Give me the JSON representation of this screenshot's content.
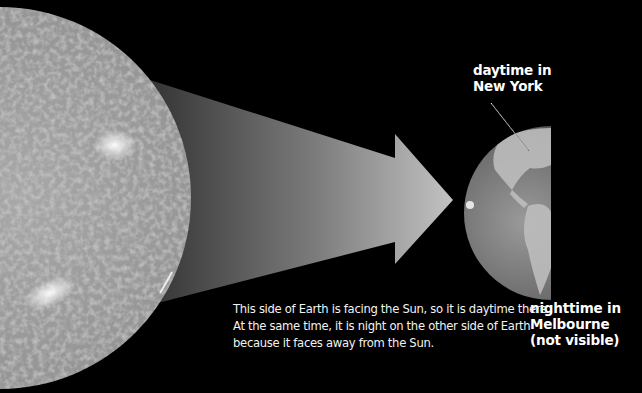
{
  "diagram": {
    "type": "illustration",
    "elements": {
      "sun": {
        "label": "Sun"
      },
      "light_beam": {
        "label": "sunlight arrow"
      },
      "earth": {
        "label": "Earth",
        "lit_side": "left (facing Sun)",
        "dark_side": "right"
      }
    }
  },
  "labels": {
    "daytime_line1": "daytime in",
    "daytime_line2": "New York",
    "nighttime_line1": "nighttime in",
    "nighttime_line2": "Melbourne",
    "nighttime_line3": "(not visible)"
  },
  "caption": {
    "text": "This side of Earth is facing the Sun, so it is daytime there. At the same time, it is night on the other side of Earth because it faces away from the Sun."
  },
  "colors": {
    "background": "#000000",
    "text": "#ffffff",
    "sun": "#9a9a9a",
    "beam": "#cfcfcf"
  }
}
